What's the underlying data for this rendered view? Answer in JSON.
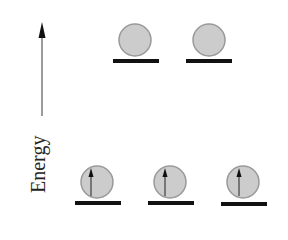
{
  "diagram": {
    "axis": {
      "label": "Energy",
      "direction": "up"
    },
    "levels": [
      {
        "name": "upper-level",
        "orbitals": [
          {
            "electron": "none"
          },
          {
            "electron": "none"
          }
        ]
      },
      {
        "name": "lower-level",
        "orbitals": [
          {
            "electron": "spin-up"
          },
          {
            "electron": "spin-up"
          },
          {
            "electron": "spin-up"
          }
        ]
      }
    ],
    "colors": {
      "orbital_fill": "#cccccc",
      "orbital_stroke": "#999999",
      "line": "#111111",
      "arrow": "#222222"
    }
  }
}
